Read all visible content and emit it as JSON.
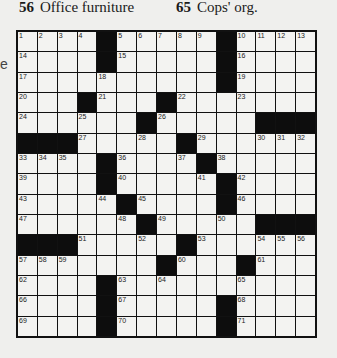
{
  "clues_header": [
    {
      "number": "56",
      "text": "Office furniture"
    },
    {
      "number": "65",
      "text": "Cops' org."
    }
  ],
  "margin_fragment": "e",
  "grid": {
    "rows": 15,
    "cols": 15,
    "pattern": [
      "....#.....#....",
      "....#.....#....",
      "..........#....",
      "...#...#.......",
      "......#.....###",
      "###.....#......",
      "....#....#.....",
      "....#.....#....",
      ".....#....#....",
      "......#.....###",
      "###.....#......",
      ".......#...#...",
      "....#..........",
      "....#.....#....",
      "....#.....#...."
    ],
    "numbers": [
      [
        1,
        2,
        3,
        4,
        0,
        5,
        6,
        7,
        8,
        9,
        0,
        10,
        11,
        12,
        13
      ],
      [
        14,
        0,
        0,
        0,
        0,
        15,
        0,
        0,
        0,
        0,
        0,
        16,
        0,
        0,
        0
      ],
      [
        17,
        0,
        0,
        0,
        18,
        0,
        0,
        0,
        0,
        0,
        0,
        19,
        0,
        0,
        0
      ],
      [
        20,
        0,
        0,
        0,
        21,
        0,
        0,
        0,
        22,
        0,
        0,
        23,
        0,
        0,
        0
      ],
      [
        24,
        0,
        0,
        25,
        0,
        0,
        0,
        26,
        0,
        0,
        0,
        0,
        0,
        0,
        0
      ],
      [
        0,
        0,
        0,
        27,
        0,
        0,
        28,
        0,
        0,
        29,
        0,
        0,
        30,
        31,
        32
      ],
      [
        33,
        34,
        35,
        0,
        0,
        36,
        0,
        0,
        37,
        0,
        38,
        0,
        0,
        0,
        0
      ],
      [
        39,
        0,
        0,
        0,
        0,
        40,
        0,
        0,
        0,
        41,
        0,
        42,
        0,
        0,
        0
      ],
      [
        43,
        0,
        0,
        0,
        44,
        0,
        45,
        0,
        0,
        0,
        0,
        46,
        0,
        0,
        0
      ],
      [
        47,
        0,
        0,
        0,
        0,
        48,
        0,
        49,
        0,
        0,
        50,
        0,
        0,
        0,
        0
      ],
      [
        0,
        0,
        0,
        51,
        0,
        0,
        52,
        0,
        0,
        53,
        0,
        0,
        54,
        55,
        56
      ],
      [
        57,
        58,
        59,
        0,
        0,
        0,
        0,
        0,
        60,
        0,
        0,
        0,
        61,
        0,
        0
      ],
      [
        62,
        0,
        0,
        0,
        0,
        63,
        0,
        64,
        0,
        0,
        0,
        65,
        0,
        0,
        0
      ],
      [
        66,
        0,
        0,
        0,
        0,
        67,
        0,
        0,
        0,
        0,
        0,
        68,
        0,
        0,
        0
      ],
      [
        69,
        0,
        0,
        0,
        0,
        70,
        0,
        0,
        0,
        0,
        0,
        71,
        0,
        0,
        0
      ]
    ]
  }
}
